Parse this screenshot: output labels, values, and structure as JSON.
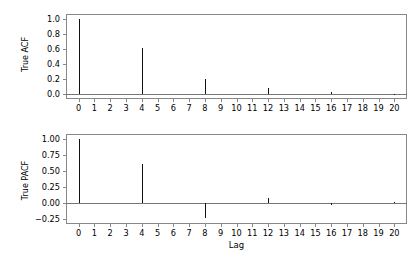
{
  "figure": {
    "background_color": "#ffffff",
    "stem_color": "#111111",
    "spine_color": "#888888",
    "baseline_color": "#777777"
  },
  "chart_data": [
    {
      "type": "bar",
      "panel": "top",
      "title": "",
      "xlabel": "",
      "ylabel": "True ACF",
      "grid": false,
      "legend": null,
      "xlim": [
        -0.8,
        20.8
      ],
      "ylim": [
        -0.06,
        1.06
      ],
      "ytick_labels": [
        "1.0",
        "0.8",
        "0.6",
        "0.4",
        "0.2",
        "0.0"
      ],
      "ytick_values": [
        1.0,
        0.8,
        0.6,
        0.4,
        0.2,
        0.0
      ],
      "xtick_labels": [
        "0",
        "1",
        "2",
        "3",
        "4",
        "5",
        "6",
        "7",
        "8",
        "9",
        "10",
        "11",
        "12",
        "13",
        "14",
        "15",
        "16",
        "17",
        "18",
        "19",
        "20"
      ],
      "categories": [
        0,
        1,
        2,
        3,
        4,
        5,
        6,
        7,
        8,
        9,
        10,
        11,
        12,
        13,
        14,
        15,
        16,
        17,
        18,
        19,
        20
      ],
      "values": [
        1.0,
        0.0,
        0.0,
        0.0,
        0.61,
        0.0,
        0.0,
        0.0,
        0.21,
        0.0,
        0.0,
        0.0,
        0.08,
        0.0,
        0.0,
        0.0,
        0.03,
        0.0,
        0.0,
        0.0,
        0.011
      ]
    },
    {
      "type": "bar",
      "panel": "bottom",
      "title": "",
      "xlabel": "Lag",
      "ylabel": "True PACF",
      "grid": false,
      "legend": null,
      "xlim": [
        -0.8,
        20.8
      ],
      "ylim": [
        -0.33,
        1.08
      ],
      "ytick_labels": [
        "1.00",
        "0.75",
        "0.50",
        "0.25",
        "0.00",
        "−0.25"
      ],
      "ytick_values": [
        1.0,
        0.75,
        0.5,
        0.25,
        0.0,
        -0.25
      ],
      "xtick_labels": [
        "0",
        "1",
        "2",
        "3",
        "4",
        "5",
        "6",
        "7",
        "8",
        "9",
        "10",
        "11",
        "12",
        "13",
        "14",
        "15",
        "16",
        "17",
        "18",
        "19",
        "20"
      ],
      "categories": [
        0,
        1,
        2,
        3,
        4,
        5,
        6,
        7,
        8,
        9,
        10,
        11,
        12,
        13,
        14,
        15,
        16,
        17,
        18,
        19,
        20
      ],
      "values": [
        1.0,
        0.0,
        0.0,
        0.0,
        0.61,
        0.0,
        0.0,
        0.0,
        -0.23,
        0.0,
        0.0,
        0.0,
        0.07,
        0.0,
        0.0,
        0.0,
        -0.03,
        0.0,
        0.0,
        0.0,
        0.01
      ]
    }
  ]
}
